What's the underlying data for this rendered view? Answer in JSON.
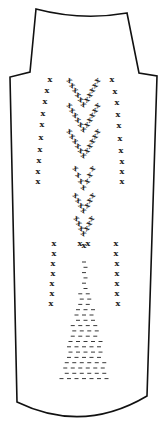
{
  "diagram": {
    "title": "",
    "type": "knitting garment panel schematic",
    "stroke_color": "#111111",
    "mark_color": "#222222",
    "background": "#ffffff",
    "symbol_x": "x",
    "symbol_dash": "-",
    "outline": {
      "top_left": [
        36,
        9
      ],
      "top_right": [
        127,
        13
      ],
      "left_shoulder": [
        [
          30,
          72
        ],
        [
          10,
          77
        ]
      ],
      "right_shoulder": [
        [
          139,
          73
        ],
        [
          157,
          76
        ]
      ],
      "bottom_left": [
        17,
        402
      ],
      "bottom_right": [
        147,
        396
      ],
      "bottom_curve_low": [
        83,
        420
      ]
    },
    "upper_side_columns": {
      "left": [
        [
          50,
          82
        ],
        [
          47,
          93
        ],
        [
          45,
          104
        ],
        [
          43,
          116
        ],
        [
          42,
          127
        ],
        [
          41,
          140
        ],
        [
          40,
          152
        ],
        [
          39,
          163
        ],
        [
          38,
          174
        ],
        [
          38,
          184
        ]
      ],
      "right": [
        [
          112,
          82
        ],
        [
          115,
          94
        ],
        [
          117,
          105
        ],
        [
          118,
          117
        ],
        [
          119,
          128
        ],
        [
          120,
          141
        ],
        [
          121,
          153
        ],
        [
          122,
          164
        ],
        [
          122,
          174
        ],
        [
          122,
          184
        ]
      ]
    },
    "lower_side_columns": {
      "left": [
        [
          54,
          246
        ],
        [
          54,
          256
        ],
        [
          53,
          266
        ],
        [
          53,
          276
        ],
        [
          52,
          286
        ],
        [
          52,
          296
        ],
        [
          51,
          306
        ]
      ],
      "right": [
        [
          116,
          246
        ],
        [
          116,
          256
        ],
        [
          117,
          266
        ],
        [
          117,
          276
        ],
        [
          117,
          286
        ],
        [
          117,
          296
        ],
        [
          118,
          306
        ]
      ]
    },
    "chevrons": [
      {
        "apex": [
          84,
          107
        ],
        "left_top": [
          70,
          83
        ],
        "right_top": [
          97,
          83
        ],
        "count": 6
      },
      {
        "apex": [
          84,
          132
        ],
        "left_top": [
          70,
          108
        ],
        "right_top": [
          97,
          108
        ],
        "count": 6
      },
      {
        "apex": [
          84,
          158
        ],
        "left_top": [
          70,
          134
        ],
        "right_top": [
          97,
          134
        ],
        "count": 6
      },
      {
        "apex": [
          84,
          190
        ],
        "left_top": [
          76,
          171
        ],
        "right_top": [
          92,
          171
        ],
        "count": 4
      },
      {
        "apex": [
          84,
          213
        ],
        "left_top": [
          76,
          198
        ],
        "right_top": [
          92,
          198
        ],
        "count": 4
      },
      {
        "apex": [
          84,
          236
        ],
        "left_top": [
          77,
          221
        ],
        "right_top": [
          91,
          221
        ],
        "count": 4
      }
    ],
    "center_small": [
      [
        84,
        248
      ],
      [
        80,
        246
      ],
      [
        88,
        246
      ]
    ],
    "dash_triangle": {
      "apex": [
        84,
        262
      ],
      "base_y": 378,
      "base_left": 58,
      "base_right": 108,
      "row_spacing": 5.3
    }
  }
}
